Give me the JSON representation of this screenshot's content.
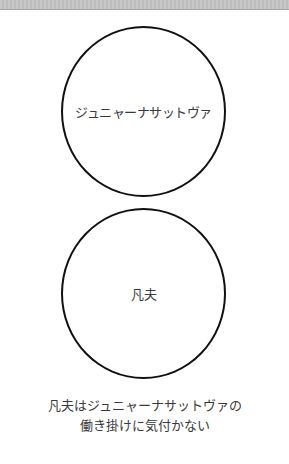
{
  "diagram": {
    "circles": [
      {
        "label": "ジュニャーナサットヴァ"
      },
      {
        "label": "凡夫"
      }
    ],
    "caption": {
      "line1": "凡夫はジュニャーナサットヴァの",
      "line2": "働き掛けに気付かない"
    },
    "colors": {
      "stroke": "#111111",
      "text": "#3a3a3a",
      "background": "#ffffff"
    }
  }
}
